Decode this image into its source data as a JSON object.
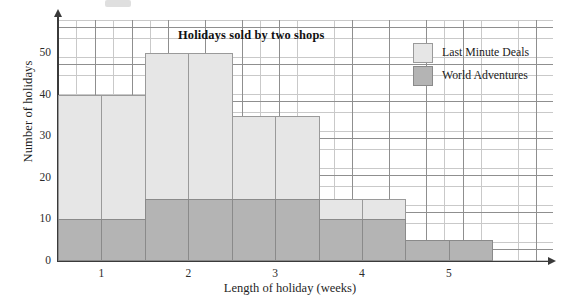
{
  "chart_data": {
    "type": "bar",
    "title": "Holidays sold by two shops",
    "xlabel": "Length of holiday (weeks)",
    "ylabel": "Number of holidays",
    "grid": true,
    "legend_position": "top-right",
    "xlim": [
      0.5,
      6.2
    ],
    "ylim": [
      0,
      58
    ],
    "x_ticks": [
      "1",
      "2",
      "3",
      "4",
      "5"
    ],
    "x_tick_values": [
      1,
      2,
      3,
      4,
      5
    ],
    "y_ticks": [
      "0",
      "10",
      "20",
      "30",
      "40",
      "50"
    ],
    "y_tick_values": [
      0,
      10,
      20,
      30,
      40,
      50
    ],
    "bin_edges": [
      0.5,
      1.0,
      1.5,
      2.0,
      2.5,
      3.0,
      3.5,
      4.0,
      4.5,
      5.0,
      5.5
    ],
    "categories": [
      "0.5-1",
      "1-1.5",
      "1.5-2",
      "2-2.5",
      "2.5-3",
      "3-3.5",
      "3.5-4",
      "4-4.5",
      "4.5-5",
      "5-5.5"
    ],
    "series": [
      {
        "name": "Last Minute Deals",
        "color": "#e6e6e6",
        "values": [
          40,
          40,
          50,
          50,
          35,
          35,
          15,
          15,
          0,
          0
        ]
      },
      {
        "name": "World Adventures",
        "color": "#b4b4b4",
        "values": [
          10,
          10,
          15,
          15,
          15,
          15,
          10,
          10,
          5,
          5
        ]
      }
    ]
  },
  "legend": {
    "items": [
      {
        "label": "Last Minute Deals",
        "swatch": "light"
      },
      {
        "label": "World Adventures",
        "swatch": "dark"
      }
    ]
  }
}
